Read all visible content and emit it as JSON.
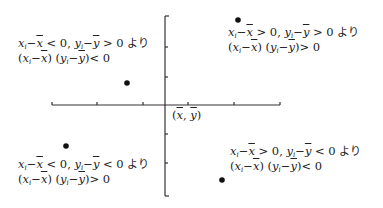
{
  "diagram": {
    "title": "",
    "axes": {
      "origin_label_parts": [
        "(",
        "x",
        ", ",
        "y",
        ")"
      ],
      "origin_label": "(x̄, ȳ)",
      "x_axis": {
        "x1": 52,
        "x2": 280,
        "y": 105,
        "ticks": [
          52,
          97,
          143,
          188,
          234,
          280
        ]
      },
      "y_axis": {
        "x": 165,
        "y1": 16,
        "y2": 196,
        "ticks": [
          16,
          47,
          77,
          134,
          163,
          194
        ]
      },
      "color": "#333333"
    },
    "points": [
      {
        "quadrant": "I",
        "cx": 238,
        "cy": 20
      },
      {
        "quadrant": "II",
        "cx": 127,
        "cy": 83
      },
      {
        "quadrant": "III",
        "cx": 66,
        "cy": 146
      },
      {
        "quadrant": "IV",
        "cx": 222,
        "cy": 180
      }
    ],
    "quadrants": {
      "q1": {
        "x_sign": ">",
        "y_sign": ">",
        "cond_text": "xᵢ−x̄ > 0, yᵢ−ȳ > 0 より",
        "result_sign": ">",
        "result_text": "(xᵢ−x̄)(yᵢ−ȳ) > 0",
        "yori": "より",
        "zero": "0"
      },
      "q2": {
        "x_sign": "<",
        "y_sign": ">",
        "cond_text": "xᵢ−x̄ < 0, yᵢ−ȳ > 0 より",
        "result_sign": "<",
        "result_text": "(xᵢ−x̄)(yᵢ−ȳ) < 0",
        "yori": "より",
        "zero": "0"
      },
      "q3": {
        "x_sign": "<",
        "y_sign": "<",
        "cond_text": "xᵢ−x̄ < 0, yᵢ−ȳ < 0 より",
        "result_sign": ">",
        "result_text": "(xᵢ−x̄)(yᵢ−ȳ) > 0",
        "yori": "より",
        "zero": "0"
      },
      "q4": {
        "x_sign": ">",
        "y_sign": "<",
        "cond_text": "xᵢ−x̄ > 0, yᵢ−ȳ < 0 より",
        "result_sign": "<",
        "result_text": "(xᵢ−x̄)(yᵢ−ȳ) < 0",
        "yori": "より",
        "zero": "0"
      }
    },
    "symbols": {
      "x": "x",
      "y": "y",
      "i": "i",
      "minus": "−",
      "comma": ", ",
      "lparen": "(",
      "rparen": ")"
    }
  }
}
